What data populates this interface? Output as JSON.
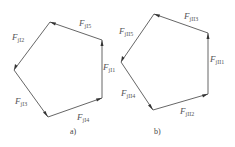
{
  "diagrams": [
    {
      "id": "a",
      "caption": "a)",
      "vertices": {
        "top": [
          50,
          22
        ],
        "top_right": [
          102,
          40
        ],
        "bottom_right": [
          102,
          98
        ],
        "bottom": [
          48,
          117
        ],
        "left": [
          14,
          70
        ]
      },
      "vectors": [
        {
          "label": "F",
          "sub": "jI5",
          "from": "top_right",
          "to": "top"
        },
        {
          "label": "F",
          "sub": "jI2",
          "from": "top",
          "to": "left"
        },
        {
          "label": "F",
          "sub": "jI1",
          "from": "bottom_right",
          "to": "top_right"
        },
        {
          "label": "F",
          "sub": "jI3",
          "from": "left",
          "to": "bottom"
        },
        {
          "label": "F",
          "sub": "jI4",
          "from": "bottom",
          "to": "bottom_right"
        }
      ]
    },
    {
      "id": "b",
      "caption": "b)",
      "vertices": {
        "top": [
          154,
          14
        ],
        "top_right": [
          208,
          33
        ],
        "bottom_right": [
          208,
          94
        ],
        "bottom": [
          153,
          110
        ],
        "left": [
          121,
          62
        ]
      },
      "vectors": [
        {
          "label": "F",
          "sub": "jII3",
          "from": "top_right",
          "to": "top"
        },
        {
          "label": "F",
          "sub": "jII5",
          "from": "top",
          "to": "left"
        },
        {
          "label": "F",
          "sub": "jII1",
          "from": "bottom_right",
          "to": "top_right"
        },
        {
          "label": "F",
          "sub": "jII4",
          "from": "left",
          "to": "bottom"
        },
        {
          "label": "F",
          "sub": "jII2",
          "from": "bottom",
          "to": "bottom_right"
        }
      ]
    }
  ],
  "labels": {
    "a": {
      "F5": "F",
      "s5": "jI5",
      "F2": "F",
      "s2": "jI2",
      "F1": "F",
      "s1": "jI1",
      "F3": "F",
      "s3": "jI3",
      "F4": "F",
      "s4": "jI4",
      "caption": "a)"
    },
    "b": {
      "F3": "F",
      "s3": "jII3",
      "F5": "F",
      "s5": "jII5",
      "F1": "F",
      "s1": "jII1",
      "F4": "F",
      "s4": "jII4",
      "F2": "F",
      "s2": "jII2",
      "caption": "b)"
    }
  },
  "colors": {
    "line": "#555555",
    "arrow": "#333333",
    "text": "#555555"
  }
}
